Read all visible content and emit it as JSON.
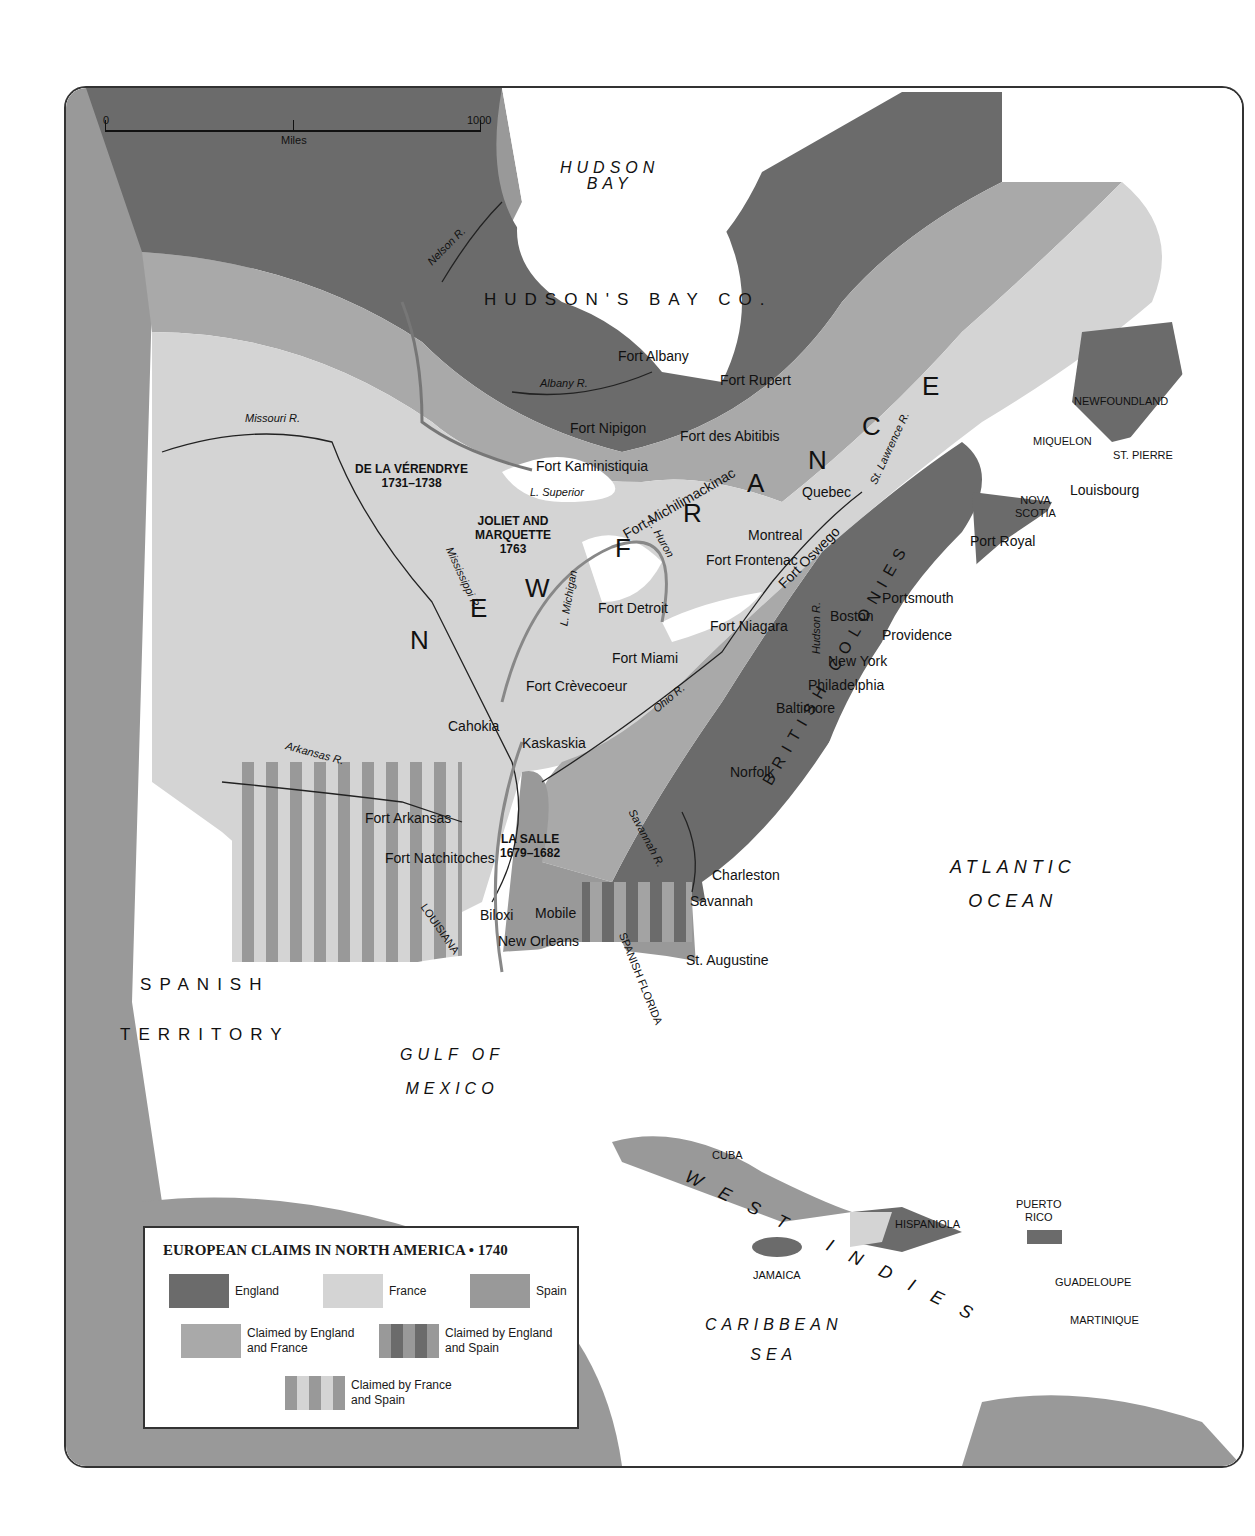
{
  "title": "EUROPEAN CLAIMS IN NORTH AMERICA • 1740",
  "colors": {
    "england": "#6b6b6b",
    "france": "#d4d4d4",
    "spain": "#999999",
    "england_france": "#a9a9a9",
    "water": "#ffffff",
    "border": "#333333"
  },
  "scale_bar": {
    "start": "0",
    "end": "1000",
    "unit": "Miles"
  },
  "legend": {
    "title": "EUROPEAN CLAIMS IN NORTH AMERICA • 1740",
    "items": [
      {
        "label": "England",
        "swatch": "england"
      },
      {
        "label": "France",
        "swatch": "france"
      },
      {
        "label": "Spain",
        "swatch": "spain"
      },
      {
        "label": "Claimed by England and France",
        "line1": "Claimed by England",
        "line2": "and France",
        "swatch": "england-france"
      },
      {
        "label": "Claimed by England and Spain",
        "line1": "Claimed by England",
        "line2": "and Spain",
        "swatch": "england-spain-stripes"
      },
      {
        "label": "Claimed by France and Spain",
        "line1": "Claimed by France",
        "line2": "and Spain",
        "swatch": "france-spain-stripes"
      }
    ]
  },
  "water_bodies": {
    "hudson_bay": [
      "HUDSON",
      "BAY"
    ],
    "atlantic": [
      "ATLANTIC",
      "OCEAN"
    ],
    "gulf": [
      "GULF OF",
      "MEXICO"
    ],
    "caribbean": [
      "CARIBBEAN",
      "SEA"
    ],
    "lake_superior": "L. Superior",
    "lake_michigan": "L. Michigan",
    "lake_huron": "L. Huron"
  },
  "regions": {
    "hudsons_bay_co": "HUDSON'S BAY CO.",
    "new_france": [
      "N",
      "E",
      "W",
      "F",
      "R",
      "A",
      "N",
      "C",
      "E"
    ],
    "british_colonies": "BRITISH COLONIES",
    "spanish_territory": [
      "SPANISH",
      "TERRITORY"
    ],
    "louisiana": "LOUISIANA",
    "spanish_florida": "SPANISH FLORIDA",
    "west_indies": [
      "W",
      "E",
      "S",
      "T",
      "I",
      "N",
      "D",
      "I",
      "E",
      "S"
    ],
    "newfoundland": "NEWFOUNDLAND",
    "nova_scotia": [
      "NOVA",
      "SCOTIA"
    ],
    "miquelon": "MIQUELON",
    "st_pierre": "ST. PIERRE",
    "cuba": "CUBA",
    "jamaica": "JAMAICA",
    "hispaniola": "HISPANIOLA",
    "puerto_rico": [
      "PUERTO",
      "RICO"
    ],
    "guadeloupe": "GUADELOUPE",
    "martinique": "MARTINIQUE"
  },
  "rivers": {
    "nelson": "Nelson R.",
    "albany": "Albany R.",
    "missouri": "Missouri R.",
    "mississippi": "Mississippi R.",
    "arkansas": "Arkansas R.",
    "ohio": "Ohio R.",
    "st_lawrence": "St. Lawrence R.",
    "hudson": "Hudson R.",
    "savannah": "Savannah R."
  },
  "forts": [
    {
      "name": "Fort Albany"
    },
    {
      "name": "Fort Rupert"
    },
    {
      "name": "Fort Nipigon"
    },
    {
      "name": "Fort des Abitibis"
    },
    {
      "name": "Fort Kaministiquia"
    },
    {
      "name": "Fort Michilimackinac"
    },
    {
      "name": "Fort Frontenac"
    },
    {
      "name": "Fort Oswego"
    },
    {
      "name": "Fort Niagara"
    },
    {
      "name": "Fort Detroit"
    },
    {
      "name": "Fort Miami"
    },
    {
      "name": "Fort Crèvecoeur"
    },
    {
      "name": "Fort Arkansas"
    },
    {
      "name": "Fort Natchitoches"
    }
  ],
  "cities": [
    "Quebec",
    "Montreal",
    "Louisbourg",
    "Port Royal",
    "Portsmouth",
    "Boston",
    "Providence",
    "New York",
    "Philadelphia",
    "Baltimore",
    "Norfolk",
    "Charleston",
    "Savannah",
    "St. Augustine",
    "Cahokia",
    "Kaskaskia",
    "Biloxi",
    "Mobile",
    "New Orleans"
  ],
  "explorers": [
    {
      "name": "DE LA VÉRENDRYE",
      "years": "1731–1738"
    },
    {
      "name": "JOLIET AND MARQUETTE",
      "line1": "JOLIET AND",
      "line2": "MARQUETTE",
      "years": "1763"
    },
    {
      "name": "LA SALLE",
      "years": "1679–1682"
    }
  ]
}
